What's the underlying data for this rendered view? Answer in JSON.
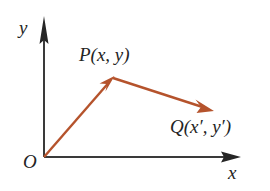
{
  "figure": {
    "background_color": "#ffffff",
    "width": 270,
    "height": 191
  },
  "axes": {
    "color": "#3a3a3a",
    "x_axis": {
      "label": "x",
      "start": [
        44,
        157
      ],
      "end": [
        240,
        157
      ],
      "arrowhead": "solid-triangle"
    },
    "y_axis": {
      "label": "y",
      "start": [
        44,
        157
      ],
      "end": [
        44,
        20
      ],
      "arrowhead": "narrow-triangle"
    },
    "origin_label": "O"
  },
  "vectors": {
    "color": "#b5532c",
    "items": [
      {
        "name": "OP",
        "from": [
          44,
          157
        ],
        "to": [
          113,
          78
        ],
        "arrowhead": "solid-triangle"
      },
      {
        "name": "PQ",
        "from": [
          113,
          78
        ],
        "to": [
          212,
          110
        ],
        "arrowhead": "solid-triangle"
      }
    ]
  },
  "points": [
    {
      "id": "P",
      "label": "P(x, y)",
      "position": [
        113,
        78
      ]
    },
    {
      "id": "Q",
      "label": "Q(x′, y′)",
      "position": [
        212,
        110
      ]
    }
  ]
}
